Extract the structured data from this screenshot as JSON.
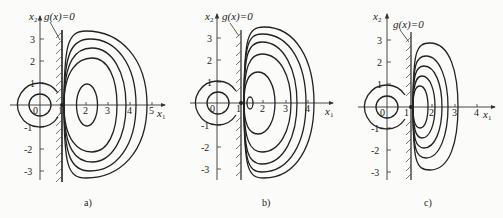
{
  "figure": {
    "panels": [
      {
        "id": "a",
        "caption": "a)",
        "x_axis_label": "x1",
        "y_axis_label": "x2",
        "constraint_label": "g(x)=0",
        "x_ticks": [
          "0",
          "1",
          "2",
          "3",
          "4",
          "5"
        ],
        "y_ticks": [
          "3",
          "2",
          "1",
          "-1",
          "-2",
          "-3"
        ],
        "description": "Concentric circles around origin; constraint wall at x1=1 with hatching; nested closed contours centered near (2,0) on feasible side"
      },
      {
        "id": "b",
        "caption": "b)",
        "x_axis_label": "x1",
        "y_axis_label": "x2",
        "constraint_label": "g(x)=0",
        "x_ticks": [
          "0",
          "1",
          "2",
          "3",
          "4"
        ],
        "y_ticks": [
          "3",
          "2",
          "1",
          "-1",
          "-2",
          "-3"
        ],
        "description": "Concentric circles around origin; constraint wall at x1=1; nested contours with small ellipse near (1.4,0)"
      },
      {
        "id": "c",
        "caption": "c)",
        "x_axis_label": "x1",
        "y_axis_label": "x2",
        "constraint_label": "g(x)=0",
        "x_ticks": [
          "0",
          "1",
          "2",
          "3",
          "4"
        ],
        "y_ticks": [
          "3",
          "2",
          "1",
          "-1",
          "-2",
          "-3"
        ],
        "description": "Concentric circles around origin; constraint wall at x1=1; tightly nested contours hugging the wall"
      }
    ]
  }
}
